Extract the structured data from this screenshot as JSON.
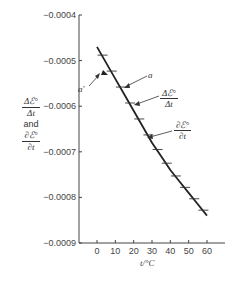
{
  "chart_data": {
    "type": "line",
    "title": "",
    "xlabel": "t/°C",
    "ylabel": "Δℰ°/Δt and ∂ℰ°/∂t",
    "ylabel_parts": {
      "frac1_num": "Δℰ°",
      "frac1_den": "Δt",
      "and": "and",
      "frac2_num": "∂ℰ°",
      "frac2_den": "∂t"
    },
    "x_ticks": [
      0,
      10,
      20,
      30,
      40,
      50,
      60
    ],
    "x_tick_labels": [
      "0",
      "10",
      "20",
      "30",
      "40",
      "50",
      "60"
    ],
    "y_ticks": [
      -0.0004,
      -0.0005,
      -0.0006,
      -0.0007,
      -0.0008,
      -0.0009
    ],
    "y_tick_labels": [
      "−0.0004",
      "−0.0005",
      "−0.0006",
      "−0.0007",
      "−0.0008",
      "−0.0009"
    ],
    "ylim": [
      -0.0009,
      -0.0004
    ],
    "xlim": [
      -10,
      70
    ],
    "grid": false,
    "series": [
      {
        "name": "∂ℰ°/∂t (curve)",
        "x": [
          0,
          5,
          10,
          15,
          20,
          25,
          30,
          35,
          40,
          45,
          50,
          55,
          60
        ],
        "values": [
          -0.00047,
          -0.000505,
          -0.00054,
          -0.000575,
          -0.00061,
          -0.000645,
          -0.00068,
          -0.00071,
          -0.00074,
          -0.000765,
          -0.00079,
          -0.000815,
          -0.00084
        ]
      },
      {
        "name": "Δℰ°/Δt (horizontal dash markers)",
        "x": [
          2.5,
          7.5,
          12.5,
          17.5,
          22.5,
          27.5,
          32.5,
          37.5,
          42.5,
          47.5,
          52.5,
          57.5
        ],
        "values": [
          -0.000488,
          -0.000523,
          -0.000558,
          -0.000593,
          -0.000628,
          -0.000663,
          -0.000695,
          -0.000725,
          -0.000753,
          -0.000778,
          -0.000803,
          -0.000828
        ]
      }
    ],
    "annotations": [
      {
        "label": "a′",
        "points_to": "filled triangle marker near t≈5"
      },
      {
        "label": "a",
        "points_to": "dash marker near t≈13"
      },
      {
        "label": "Δℰ°/Δt",
        "points_to": "dash markers"
      },
      {
        "label": "∂ℰ°/∂t",
        "points_to": "curve"
      }
    ]
  },
  "labels": {
    "xlabel": "t/°C",
    "and": "and",
    "a": "a",
    "a_prime": "a′",
    "delta_num": "Δℰ°",
    "delta_den": "Δt",
    "partial_num": "∂ℰ°",
    "partial_den": "∂t"
  }
}
